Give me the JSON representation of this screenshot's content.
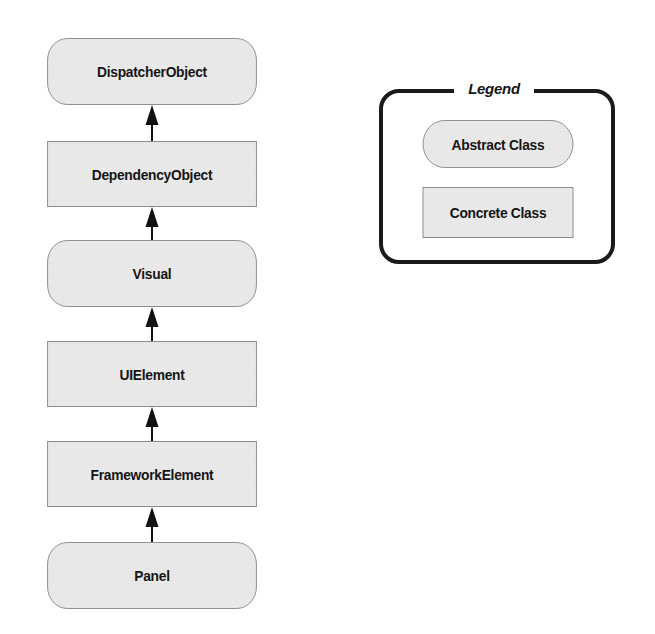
{
  "diagram": {
    "nodes": [
      {
        "id": "dispatcherobject",
        "label": "DispatcherObject",
        "kind": "abstract"
      },
      {
        "id": "dependencyobject",
        "label": "DependencyObject",
        "kind": "concrete"
      },
      {
        "id": "visual",
        "label": "Visual",
        "kind": "abstract"
      },
      {
        "id": "uielement",
        "label": "UIElement",
        "kind": "concrete"
      },
      {
        "id": "frameworkelement",
        "label": "FrameworkElement",
        "kind": "concrete"
      },
      {
        "id": "panel",
        "label": "Panel",
        "kind": "abstract"
      }
    ],
    "edges": [
      {
        "from": "dependencyobject",
        "to": "dispatcherobject",
        "type": "inherits"
      },
      {
        "from": "visual",
        "to": "dependencyobject",
        "type": "inherits"
      },
      {
        "from": "uielement",
        "to": "visual",
        "type": "inherits"
      },
      {
        "from": "frameworkelement",
        "to": "uielement",
        "type": "inherits"
      },
      {
        "from": "panel",
        "to": "frameworkelement",
        "type": "inherits"
      }
    ]
  },
  "legend": {
    "title": "Legend",
    "items": [
      {
        "label": "Abstract Class",
        "shape": "rounded-rectangle"
      },
      {
        "label": "Concrete Class",
        "shape": "rectangle"
      }
    ]
  },
  "colors": {
    "node_fill": "#e9e9e9",
    "node_border": "#8a8a8a",
    "text": "#151515",
    "legend_border": "#1a1a1a",
    "arrow": "#111111"
  }
}
